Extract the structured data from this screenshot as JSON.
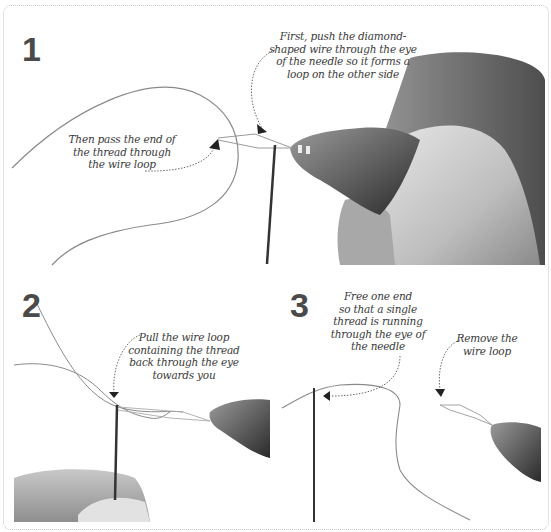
{
  "steps": [
    {
      "number": "1",
      "captions": [
        {
          "lines": [
            "First, push the diamond-",
            "shaped wire through the eye",
            "of the needle so it forms a",
            "loop on the other side"
          ]
        },
        {
          "lines": [
            "Then pass the end of",
            "the thread through",
            "the wire loop"
          ]
        }
      ]
    },
    {
      "number": "2",
      "captions": [
        {
          "lines": [
            "Pull the wire loop",
            "containing the thread",
            "back through the eye",
            "towards you"
          ]
        }
      ]
    },
    {
      "number": "3",
      "captions": [
        {
          "lines": [
            "Free one end",
            "so that a single",
            "thread is running",
            "through the eye of",
            "the needle"
          ]
        },
        {
          "lines": [
            "Remove the",
            "wire loop"
          ]
        }
      ]
    }
  ],
  "colors": {
    "step_number": "#4a4a4a",
    "caption_text": "#3a3a3a",
    "frame_border": "#c8c8c8",
    "thread": "#8a8a8a",
    "needle": "#333333"
  }
}
